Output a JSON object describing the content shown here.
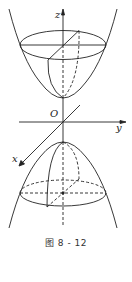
{
  "figure": {
    "caption": "图 8 - 12",
    "axes": {
      "x_label": "x",
      "y_label": "y",
      "z_label": "z",
      "origin_label": "O"
    },
    "surfaces": [
      {
        "name": "upper-paraboloid-sheet",
        "opens": "up"
      },
      {
        "name": "lower-paraboloid-sheet",
        "opens": "down"
      }
    ],
    "colors": {
      "stroke": "#222222",
      "background": "#ffffff"
    }
  }
}
